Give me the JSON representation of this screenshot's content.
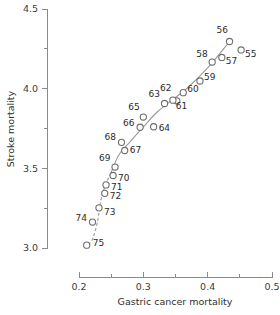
{
  "chart_data": {
    "type": "scatter",
    "title": "",
    "xlabel": "Gastric cancer mortality",
    "ylabel": "Stroke mortality",
    "xlim": [
      0.2,
      0.5
    ],
    "ylim": [
      3.0,
      4.5
    ],
    "xticks": [
      0.2,
      0.3,
      0.4,
      0.5
    ],
    "xtick_labels": [
      "0.2",
      "0.3",
      "0.4",
      "0.5"
    ],
    "xminorticks": [
      0.25,
      0.35,
      0.45
    ],
    "yticks": [
      3.0,
      3.5,
      4.0,
      4.5
    ],
    "ytick_labels": [
      "3.0",
      "3.5",
      "4.0",
      "4.5"
    ],
    "yminorticks": [
      3.25,
      3.75,
      4.25
    ],
    "grid": false,
    "legend": false,
    "marker": "open-circle",
    "point_label_field": "label",
    "points": [
      {
        "label": "55",
        "x": 0.452,
        "y": 4.243,
        "label_dx": 4,
        "label_dy": 11
      },
      {
        "label": "56",
        "x": 0.434,
        "y": 4.296,
        "label_dx": -13,
        "label_dy": -5
      },
      {
        "label": "57",
        "x": 0.422,
        "y": 4.196,
        "label_dx": 4,
        "label_dy": 11
      },
      {
        "label": "58",
        "x": 0.407,
        "y": 4.167,
        "label_dx": -16,
        "label_dy": -1
      },
      {
        "label": "59",
        "x": 0.388,
        "y": 4.048,
        "label_dx": 4,
        "label_dy": 3
      },
      {
        "label": "60",
        "x": 0.362,
        "y": 3.975,
        "label_dx": 4,
        "label_dy": 3
      },
      {
        "label": "61",
        "x": 0.352,
        "y": 3.924,
        "label_dx": -1,
        "label_dy": 12
      },
      {
        "label": "62",
        "x": 0.346,
        "y": 3.928,
        "label_dx": -13,
        "label_dy": -5
      },
      {
        "label": "63",
        "x": 0.333,
        "y": 3.907,
        "label_dx": -16,
        "label_dy": -2
      },
      {
        "label": "64",
        "x": 0.316,
        "y": 3.761,
        "label_dx": 5,
        "label_dy": 8
      },
      {
        "label": "65",
        "x": 0.3,
        "y": 3.822,
        "label_dx": -15,
        "label_dy": -3
      },
      {
        "label": "66",
        "x": 0.295,
        "y": 3.758,
        "label_dx": -17,
        "label_dy": 3
      },
      {
        "label": "67",
        "x": 0.271,
        "y": 3.612,
        "label_dx": 5,
        "label_dy": 7
      },
      {
        "label": "68",
        "x": 0.266,
        "y": 3.663,
        "label_dx": -17,
        "label_dy": 2
      },
      {
        "label": "69",
        "x": 0.256,
        "y": 3.508,
        "label_dx": -16,
        "label_dy": -2
      },
      {
        "label": "70",
        "x": 0.253,
        "y": 3.455,
        "label_dx": 5,
        "label_dy": 9
      },
      {
        "label": "71",
        "x": 0.242,
        "y": 3.396,
        "label_dx": 5,
        "label_dy": 9
      },
      {
        "label": "72",
        "x": 0.24,
        "y": 3.343,
        "label_dx": 5,
        "label_dy": 10
      },
      {
        "label": "73",
        "x": 0.231,
        "y": 3.252,
        "label_dx": 5,
        "label_dy": 11
      },
      {
        "label": "74",
        "x": 0.221,
        "y": 3.163,
        "label_dx": -17,
        "label_dy": 3
      },
      {
        "label": "75",
        "x": 0.212,
        "y": 3.018,
        "label_dx": 6,
        "label_dy": 5
      }
    ],
    "trend_line": {
      "style": "solid-with-dashed-tail",
      "description": "smooth increasing curve through the point cloud",
      "solid_path": [
        {
          "x": 0.2495,
          "y": 3.47
        },
        {
          "x": 0.262,
          "y": 3.585
        },
        {
          "x": 0.278,
          "y": 3.66
        },
        {
          "x": 0.3,
          "y": 3.76
        },
        {
          "x": 0.322,
          "y": 3.855
        },
        {
          "x": 0.345,
          "y": 3.93
        },
        {
          "x": 0.37,
          "y": 4.01
        },
        {
          "x": 0.4,
          "y": 4.13
        },
        {
          "x": 0.434,
          "y": 4.296
        }
      ],
      "dashed_path": [
        {
          "x": 0.2495,
          "y": 3.47
        },
        {
          "x": 0.2405,
          "y": 3.39
        },
        {
          "x": 0.2335,
          "y": 3.29
        },
        {
          "x": 0.229,
          "y": 3.17
        },
        {
          "x": 0.2215,
          "y": 3.06
        },
        {
          "x": 0.2145,
          "y": 3.02
        }
      ]
    }
  }
}
